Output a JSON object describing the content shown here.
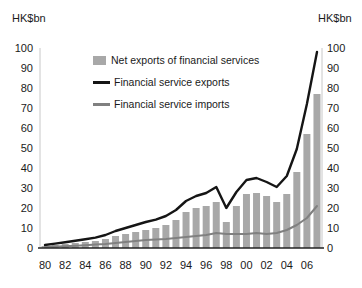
{
  "chart_data": {
    "type": "bar",
    "title": "",
    "unit_label_left": "HK$bn",
    "unit_label_right": "HK$bn",
    "ylim": [
      0,
      100
    ],
    "yticks": [
      0,
      10,
      20,
      30,
      40,
      50,
      60,
      70,
      80,
      90,
      100
    ],
    "grid": "off",
    "legend_position": "top-left-inside",
    "x_years": [
      1980,
      1981,
      1982,
      1983,
      1984,
      1985,
      1986,
      1987,
      1988,
      1989,
      1990,
      1991,
      1992,
      1993,
      1994,
      1995,
      1996,
      1997,
      1998,
      1999,
      2000,
      2001,
      2002,
      2003,
      2004,
      2005,
      2006,
      2007
    ],
    "x_tick_labels": [
      "80",
      "82",
      "84",
      "86",
      "88",
      "90",
      "92",
      "94",
      "96",
      "98",
      "00",
      "02",
      "04",
      "06"
    ],
    "series": [
      {
        "name": "Net exports of financial services",
        "type": "bar",
        "color": "#a8a8a8",
        "values": [
          1,
          1.5,
          2,
          2.5,
          3,
          3.5,
          4.5,
          6,
          7,
          8,
          9,
          10,
          11.5,
          14,
          18,
          20,
          21,
          23,
          13,
          21,
          27,
          27.5,
          26,
          23,
          27,
          38,
          57,
          77
        ]
      },
      {
        "name": "Financial service exports",
        "type": "line",
        "color": "#151515",
        "values": [
          1.5,
          2.2,
          2.9,
          3.6,
          4.4,
          5.2,
          6.5,
          8.5,
          10,
          11.5,
          13,
          14.2,
          16,
          19,
          23.5,
          26,
          27.5,
          30.5,
          20,
          28,
          34,
          35,
          33,
          30.5,
          36,
          49.5,
          72,
          98
        ]
      },
      {
        "name": "Financial service imports",
        "type": "line",
        "color": "#808080",
        "values": [
          0.5,
          0.7,
          0.9,
          1.1,
          1.4,
          1.7,
          2,
          2.5,
          3,
          3.5,
          4,
          4.2,
          4.5,
          5,
          5.5,
          6,
          6.5,
          7.5,
          7,
          7,
          7,
          7.5,
          7,
          7.5,
          9,
          11.5,
          15,
          21
        ]
      }
    ],
    "axis_color": "#222222",
    "plot_border_color": "#c8c8c8"
  }
}
